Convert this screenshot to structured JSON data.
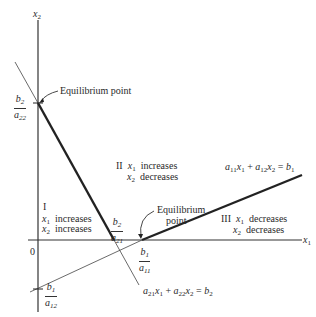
{
  "axes": {
    "x_label": "x",
    "x_sub": "1",
    "y_label": "x",
    "y_sub": "2",
    "origin": "0"
  },
  "lines": {
    "line1": {
      "equation_a": "a",
      "a_sub1": "11",
      "x_a": "x",
      "x_a_sub": "1",
      "plus": "+",
      "equation_b": "a",
      "b_sub": "12",
      "x_b": "x",
      "x_b_sub": "2",
      "eq": "=",
      "rhs": "b",
      "rhs_sub": "1"
    },
    "line2": {
      "equation_a": "a",
      "a_sub1": "21",
      "x_a": "x",
      "x_a_sub": "1",
      "plus": "+",
      "equation_b": "a",
      "b_sub": "22",
      "x_b": "x",
      "x_b_sub": "2",
      "eq": "=",
      "rhs": "b",
      "rhs_sub": "2"
    }
  },
  "intercepts": {
    "b2_a22": {
      "num": "b",
      "num_sub": "2",
      "den": "a",
      "den_sub": "22"
    },
    "b2_a21": {
      "num": "b",
      "num_sub": "2",
      "den": "a",
      "den_sub": "21"
    },
    "b1_a11": {
      "num": "b",
      "num_sub": "1",
      "den": "a",
      "den_sub": "11"
    },
    "b1_a12": {
      "num": "b",
      "num_sub": "1",
      "den": "a",
      "den_sub": "12"
    }
  },
  "annotations": {
    "equilibrium_top": "Equilibrium point",
    "equilibrium_mid_1": "Equilibrium",
    "equilibrium_mid_2": "point"
  },
  "regions": {
    "I": {
      "numeral": "I",
      "line1_var": "x",
      "line1_sub": "1",
      "line1_text": "increases",
      "line2_var": "x",
      "line2_sub": "2",
      "line2_text": "increases"
    },
    "II": {
      "numeral": "II",
      "line1_var": "x",
      "line1_sub": "1",
      "line1_text": "increases",
      "line2_var": "x",
      "line2_sub": "2",
      "line2_text": "decreases"
    },
    "III": {
      "numeral": "III",
      "line1_var": "x",
      "line1_sub": "1",
      "line1_text": "decreases",
      "line2_var": "x",
      "line2_sub": "2",
      "line2_text": "decreases"
    }
  },
  "colors": {
    "ink": "#222222",
    "background": "#ffffff"
  }
}
